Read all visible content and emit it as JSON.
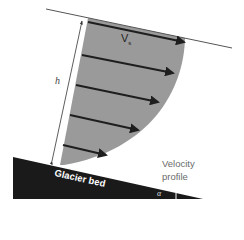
{
  "diagram": {
    "labels": {
      "surface_velocity": "V",
      "surface_velocity_sub": "s",
      "thickness": "h",
      "velocity_profile_line1": "Velocity",
      "velocity_profile_line2": "profile",
      "bed": "Glacier bed",
      "slope_angle": "α"
    },
    "colors": {
      "profile_fill": "#9a9a9a",
      "bed_fill": "#1a1a1a",
      "arrow": "#1e1e1e",
      "surface_line": "#555555"
    },
    "arrows": [
      {
        "name": "surface",
        "length_rel": 1.0
      },
      {
        "name": "depth-1",
        "length_rel": 0.87
      },
      {
        "name": "depth-2",
        "length_rel": 0.76
      },
      {
        "name": "depth-3",
        "length_rel": 0.62
      },
      {
        "name": "depth-4",
        "length_rel": 0.41
      }
    ]
  }
}
